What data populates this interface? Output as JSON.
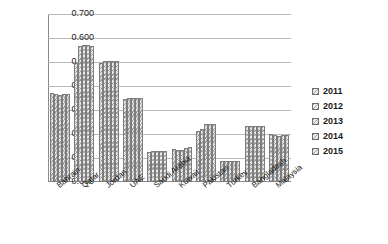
{
  "chart_data": {
    "type": "bar",
    "title": "",
    "xlabel": "",
    "ylabel": "",
    "ylim": [
      0,
      0.7
    ],
    "ytick_labels": [
      "0.700",
      "0.600",
      "0.500",
      "0.400",
      "0.300",
      "0.200",
      "0.100",
      "0.000"
    ],
    "ytick_values": [
      0.7,
      0.6,
      0.5,
      0.4,
      0.3,
      0.2,
      0.1,
      0.0
    ],
    "grid": "horizontal",
    "legend_position": "right",
    "categories": [
      "Bahrain",
      "Qatar",
      "Jordan",
      "UAE",
      "Saudi Arabia",
      "Kuwait",
      "Pakistan",
      "Turkey",
      "Bangladesh",
      "Malaysia"
    ],
    "series": [
      {
        "name": "2011",
        "values": [
          0.371,
          0.497,
          0.495,
          0.347,
          0.127,
          0.137,
          0.212,
          0.088,
          0.232,
          0.199
        ]
      },
      {
        "name": "2012",
        "values": [
          0.366,
          0.566,
          0.503,
          0.35,
          0.128,
          0.133,
          0.222,
          0.088,
          0.233,
          0.196
        ]
      },
      {
        "name": "2013",
        "values": [
          0.364,
          0.57,
          0.505,
          0.35,
          0.13,
          0.134,
          0.24,
          0.089,
          0.234,
          0.19
        ]
      },
      {
        "name": "2014",
        "values": [
          0.365,
          0.569,
          0.505,
          0.351,
          0.131,
          0.141,
          0.243,
          0.089,
          0.233,
          0.196
        ]
      },
      {
        "name": "2015",
        "values": [
          0.366,
          0.566,
          0.504,
          0.351,
          0.131,
          0.146,
          0.242,
          0.089,
          0.233,
          0.197
        ]
      }
    ]
  },
  "legend": {
    "entries": [
      "2011",
      "2012",
      "2013",
      "2014",
      "2015"
    ]
  },
  "colors": {
    "bar_fill": "#e9e9e9",
    "bar_border": "#7d7d7d",
    "gridline": "#b9b9b9",
    "axis": "#8a8a8a",
    "text": "#1a1a1a",
    "background": "#ffffff"
  }
}
